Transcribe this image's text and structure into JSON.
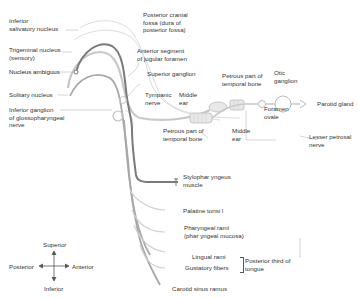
{
  "diagram": {
    "colors": {
      "text": "#333333",
      "line_dark": "#6e6e6e",
      "line_mid": "#9a9a9a",
      "line_light": "#c8c8c8",
      "leader": "#b0b0b0"
    },
    "nuclei": {
      "inferior_salivatory": [
        "Inferior",
        "salivatory nucleus"
      ],
      "trigeminal": [
        "Trigeminal nucleus",
        "(sensory)"
      ],
      "ambiguus": "Nucleus ambiguus",
      "solitary": "Solitary nucleus"
    },
    "ganglia": {
      "inferior": [
        "Inferior ganglion",
        "of glossopharyngeal",
        "nerve"
      ],
      "superior": "Superior ganglion",
      "otic": [
        "Otic",
        "ganglion"
      ]
    },
    "landmarks": {
      "posterior_fossa": [
        "Posterior cranial",
        "fossa (dura of",
        "posterior fossa)"
      ],
      "jugular": [
        "Anterior segment",
        "of jugular foramen"
      ],
      "tympanic": [
        "Tympanic",
        "nerve"
      ],
      "middle_ear_top": [
        "Middle",
        "ear"
      ],
      "petrous_top": [
        "Petrous part of",
        "temporal bone"
      ],
      "petrous_bottom": [
        "Petrous part of",
        "temporal bone"
      ],
      "middle_ear_bottom": [
        "Middle",
        "ear"
      ],
      "foramen_ovale": [
        "Foramen",
        "ovale"
      ],
      "lesser_petrosal": [
        "Lesser petrosal",
        "nerve"
      ],
      "parotid": "Parotid gland"
    },
    "branches": {
      "stylopharyngeus": [
        "Stylophar yngeus",
        "muscle"
      ],
      "palatine": "Palatine tonsi l",
      "pharyngeal": [
        "Pharyngeal rami",
        "(phar yngeal mucosa)"
      ],
      "lingual": "Lingual rami",
      "gustatory": "Gustatory fibers",
      "tongue": [
        "Posterior third of",
        "tongue"
      ],
      "carotid": "Carotid sinus ramus"
    },
    "compass": {
      "superior": "Superior",
      "inferior": "Inferior",
      "posterior": "Posterior",
      "anterior": "Anterior"
    }
  }
}
